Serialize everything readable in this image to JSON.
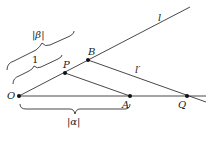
{
  "diagram": {
    "points": {
      "O": {
        "label": "O",
        "x": 19,
        "y": 96
      },
      "P": {
        "label": "P",
        "x": 65,
        "y": 73
      },
      "B": {
        "label": "B",
        "x": 88,
        "y": 60
      },
      "A": {
        "label": "A",
        "x": 130,
        "y": 96
      },
      "Q": {
        "label": "Q",
        "x": 187,
        "y": 96
      }
    },
    "lines": {
      "l": {
        "label": "l"
      },
      "l_prime": {
        "label": "l′"
      }
    },
    "braces": {
      "beta": {
        "label": "|β|"
      },
      "one": {
        "label": "1"
      },
      "alpha": {
        "label": "|α|"
      }
    }
  }
}
